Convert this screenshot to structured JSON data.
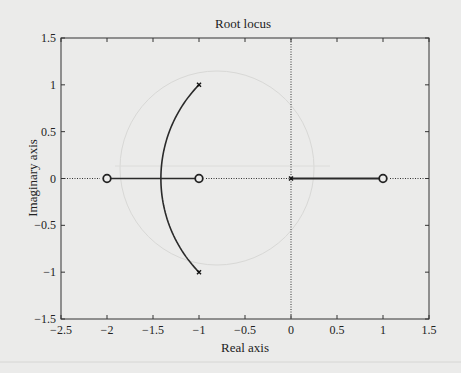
{
  "chart_data": {
    "type": "line",
    "title": "Root locus",
    "xlabel": "Real axis",
    "ylabel": "Imaginary axis",
    "xlim": [
      -2.5,
      1.5
    ],
    "ylim": [
      -1.5,
      1.5
    ],
    "grid": false,
    "xticks": [
      -2.5,
      -2,
      -1.5,
      -1,
      -0.5,
      0,
      0.5,
      1,
      1.5
    ],
    "xtick_labels": [
      "−2.5",
      "−2",
      "−1.5",
      "−1",
      "−0.5",
      "0",
      "0.5",
      "1",
      "1.5"
    ],
    "yticks": [
      -1.5,
      -1,
      -0.5,
      0,
      0.5,
      1,
      1.5
    ],
    "ytick_labels": [
      "−1.5",
      "−1",
      "−0.5",
      "0",
      "0.5",
      "1",
      "1.5"
    ],
    "poles": [
      {
        "re": -1,
        "im": 1
      },
      {
        "re": -1,
        "im": -1
      },
      {
        "re": 0,
        "im": 0
      }
    ],
    "zeros": [
      {
        "re": -2,
        "im": 0
      },
      {
        "re": -1,
        "im": 0
      },
      {
        "re": 1,
        "im": 0
      }
    ],
    "branches": [
      {
        "name": "upper complex branch",
        "from": [
          -1,
          1
        ],
        "to": [
          -1.414,
          0
        ],
        "shape": "arc of circle radius 1.414 centered at origin"
      },
      {
        "name": "lower complex branch",
        "from": [
          -1,
          -1
        ],
        "to": [
          -1.414,
          0
        ],
        "shape": "arc of circle radius 1.414 centered at origin"
      },
      {
        "name": "real-axis segment left",
        "from": [
          -2,
          0
        ],
        "to": [
          -1,
          0
        ]
      },
      {
        "name": "real-axis segment right",
        "from": [
          0,
          0
        ],
        "to": [
          1,
          0
        ]
      }
    ],
    "breakaway_point": {
      "re": -1.414,
      "im": 0
    },
    "reference_lines": [
      {
        "orientation": "horizontal",
        "value": 0,
        "style": "dotted"
      },
      {
        "orientation": "vertical",
        "value": 0,
        "style": "dotted"
      }
    ]
  },
  "colors": {
    "background": "#ebebea",
    "plot_background": "#ececeb",
    "locus": "#2a2a2a",
    "axes": "#333333",
    "ghost": "#d4d4d2"
  }
}
